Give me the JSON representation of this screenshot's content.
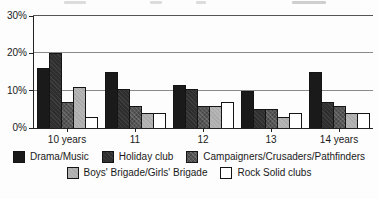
{
  "chart_data": {
    "type": "bar",
    "title": "",
    "categories": [
      "10 years",
      "11",
      "12",
      "13",
      "14 years"
    ],
    "series": [
      {
        "name": "Drama/Music",
        "color": "#1a1a1a",
        "values": [
          16,
          15,
          11.5,
          10,
          15
        ]
      },
      {
        "name": "Holiday club",
        "color": "#2e2e2e",
        "values": [
          20,
          10.5,
          10.5,
          5,
          7
        ]
      },
      {
        "name": "Campaigners/Crusaders/Pathfinders",
        "color": "#555555",
        "values": [
          7,
          6,
          6,
          5,
          6
        ]
      },
      {
        "name": "Boys' Brigade/Girls' Brigade",
        "color": "#b5b5b5",
        "values": [
          11,
          4,
          6,
          3,
          4
        ]
      },
      {
        "name": "Rock Solid clubs",
        "color": "#ffffff",
        "values": [
          3,
          4,
          7,
          4,
          4
        ]
      }
    ],
    "ylim": [
      0,
      30
    ],
    "yticks": [
      {
        "value": 0,
        "label": "0%"
      },
      {
        "value": 10,
        "label": "10%"
      },
      {
        "value": 20,
        "label": "20%"
      },
      {
        "value": 30,
        "label": "30%"
      }
    ],
    "grid": true,
    "legend_position": "bottom",
    "legend_rows": [
      [
        0,
        1,
        2
      ],
      [
        3,
        4
      ]
    ]
  }
}
